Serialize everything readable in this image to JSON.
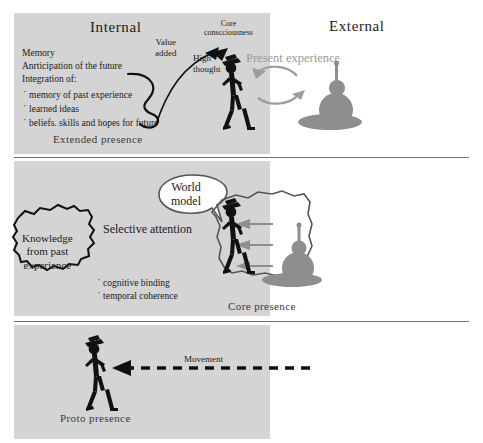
{
  "diagram": {
    "title_internal": "Internal",
    "title_external": "External",
    "colors": {
      "panel_gray": "#d4d4d4",
      "figure_black": "#111111",
      "object_gray": "#8a8a8a",
      "arrow_gray": "#9a9a9a",
      "divider": "#6f6f6f",
      "present_experience_gray": "#a0a0a0"
    }
  },
  "panel_top": {
    "list": {
      "line1": "Memory",
      "line2": "Anrticipation of the future",
      "line3": "Integration of:",
      "bullets": [
        "memory of past experience",
        "learned ideas",
        "beliefs. skills and hopes for future"
      ]
    },
    "value_added": "Value\nadded",
    "core_consciousness": "Core\nconscciousness",
    "high_thought": "High\nthought",
    "present_experience": "Present experience",
    "presence_label": "Extended presence"
  },
  "panel_mid": {
    "world_model": "World\nmodel",
    "knowledge_cloud": "Knowledge\nfrom past\nexperience",
    "selective_attention": "Selective attention",
    "bullets": [
      "cognitive binding",
      "temporal coherence"
    ],
    "presence_label": "Core presence"
  },
  "panel_bottom": {
    "movement": "Movement",
    "presence_label": "Proto presence"
  }
}
